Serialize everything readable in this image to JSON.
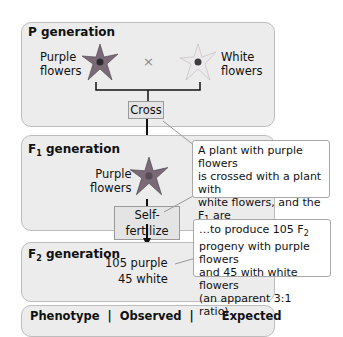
{
  "p_generation": {
    "title": "P generation",
    "left_label_1": "Purple",
    "left_label_2": "flowers",
    "cross_symbol": "×",
    "right_label_1": "White",
    "right_label_2": "flowers",
    "cross_box": "Cross"
  },
  "f1_generation": {
    "title_prefix": "F",
    "title_sub": "1",
    "title_suffix": " generation",
    "label_1": "Purple",
    "label_2": "flowers",
    "self_box": "Self-fertilize"
  },
  "f2_generation": {
    "title_prefix": "F",
    "title_sub": "2",
    "title_suffix": " generation",
    "purple": "105 purple",
    "white": "45 white"
  },
  "callouts": {
    "first_l1": "A plant with purple flowers",
    "first_l2": "is crossed with a plant with",
    "first_l3a": "white flowers, and the F",
    "first_l3sub": "1",
    "first_l3b": " are",
    "first_l4": "self-fertilized…",
    "second_l1a": "…to produce 105 F",
    "second_l1sub": "2",
    "second_l2": "progeny with purple flowers",
    "second_l3": "and 45 with white flowers",
    "second_l4": "(an apparent 3:1 ratio)."
  },
  "table": {
    "header": "Phenotype  |  Observed  |       Expected"
  },
  "colors": {
    "panel_bg": "#ececec",
    "purple_flower": "#7a6a78",
    "white_flower": "#d8d4d8"
  }
}
